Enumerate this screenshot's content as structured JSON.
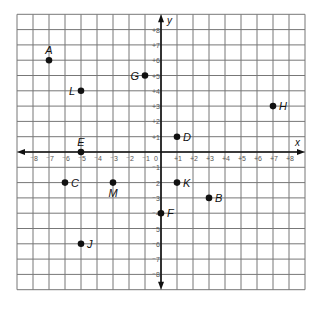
{
  "chart_data": {
    "type": "scatter",
    "title": "",
    "xlabel": "x",
    "ylabel": "y",
    "xlim": [
      -9,
      9
    ],
    "ylim": [
      -9,
      9
    ],
    "grid": true,
    "x_ticks": [
      -8,
      -7,
      -6,
      -5,
      -4,
      -3,
      -2,
      -1,
      0,
      1,
      2,
      3,
      4,
      5,
      6,
      7,
      8
    ],
    "y_ticks": [
      -8,
      -7,
      -6,
      -5,
      -4,
      -3,
      -2,
      -1,
      1,
      2,
      3,
      4,
      5,
      6,
      7,
      8
    ],
    "origin_label": "0",
    "points": [
      {
        "name": "A",
        "x": -7,
        "y": 6,
        "label_pos": "above"
      },
      {
        "name": "B",
        "x": 3,
        "y": -3,
        "label_pos": "right"
      },
      {
        "name": "C",
        "x": -6,
        "y": -2,
        "label_pos": "right"
      },
      {
        "name": "D",
        "x": 1,
        "y": 1,
        "label_pos": "right"
      },
      {
        "name": "E",
        "x": -5,
        "y": 0,
        "label_pos": "above"
      },
      {
        "name": "F",
        "x": 0,
        "y": -4,
        "label_pos": "right"
      },
      {
        "name": "G",
        "x": -1,
        "y": 5,
        "label_pos": "left"
      },
      {
        "name": "H",
        "x": 7,
        "y": 3,
        "label_pos": "right"
      },
      {
        "name": "J",
        "x": -5,
        "y": -6,
        "label_pos": "right"
      },
      {
        "name": "K",
        "x": 1,
        "y": -2,
        "label_pos": "right"
      },
      {
        "name": "L",
        "x": -5,
        "y": 4,
        "label_pos": "left"
      },
      {
        "name": "M",
        "x": -3,
        "y": -2,
        "label_pos": "below"
      }
    ]
  }
}
